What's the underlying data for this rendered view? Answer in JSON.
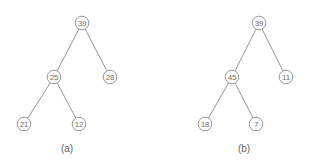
{
  "figure": {
    "background_color": "#ffffff",
    "node_stroke_color": "#8a8a8a",
    "node_fill_color": "#ffffff",
    "edge_color": "#8a8a8a",
    "text_color": "#6e6e6e",
    "caption_color": "#5f5f5f"
  },
  "chart_data": {
    "type": "diagram",
    "subtype": "binary-tree",
    "title": "",
    "panels": [
      {
        "id": "a",
        "caption": "(a)",
        "caption_x": 67,
        "caption_y": 148,
        "node_radius": 6.8,
        "nodes": [
          {
            "id": "a-root",
            "label": "39",
            "x": 82,
            "y": 23,
            "role": "root"
          },
          {
            "id": "a-left",
            "label": "25",
            "x": 54,
            "y": 77,
            "role": "internal"
          },
          {
            "id": "a-right",
            "label": "28",
            "x": 110,
            "y": 77,
            "role": "leaf"
          },
          {
            "id": "a-ll",
            "label": "21",
            "x": 24,
            "y": 124,
            "role": "leaf"
          },
          {
            "id": "a-lr",
            "label": "12",
            "x": 79,
            "y": 124,
            "role": "leaf"
          }
        ],
        "edges": [
          {
            "from": "a-root",
            "to": "a-left"
          },
          {
            "from": "a-root",
            "to": "a-right"
          },
          {
            "from": "a-left",
            "to": "a-ll"
          },
          {
            "from": "a-left",
            "to": "a-lr"
          }
        ]
      },
      {
        "id": "b",
        "caption": "(b)",
        "caption_x": 244,
        "caption_y": 148,
        "node_radius": 6.8,
        "nodes": [
          {
            "id": "b-root",
            "label": "39",
            "x": 259,
            "y": 23,
            "role": "root"
          },
          {
            "id": "b-left",
            "label": "45",
            "x": 232,
            "y": 77,
            "role": "internal"
          },
          {
            "id": "b-right",
            "label": "11",
            "x": 286,
            "y": 77,
            "role": "leaf"
          },
          {
            "id": "b-ll",
            "label": "18",
            "x": 205,
            "y": 124,
            "role": "leaf"
          },
          {
            "id": "b-lr",
            "label": "7",
            "x": 256,
            "y": 124,
            "role": "leaf"
          }
        ],
        "edges": [
          {
            "from": "b-root",
            "to": "b-left"
          },
          {
            "from": "b-root",
            "to": "b-right"
          },
          {
            "from": "b-left",
            "to": "b-ll"
          },
          {
            "from": "b-left",
            "to": "b-lr"
          }
        ]
      }
    ]
  }
}
